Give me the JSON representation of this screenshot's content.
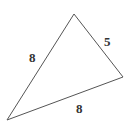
{
  "diagram": {
    "type": "triangle",
    "vertices": {
      "top": [
        74,
        14
      ],
      "right": [
        123,
        77
      ],
      "bottom_left": [
        7,
        120
      ]
    },
    "sides": [
      {
        "name": "left",
        "label": "8"
      },
      {
        "name": "right",
        "label": "5"
      },
      {
        "name": "bottom",
        "label": "8"
      }
    ],
    "stroke_color": "#444444"
  }
}
